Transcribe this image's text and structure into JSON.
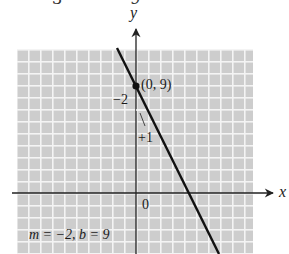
{
  "cropped_top_fragments": [
    "3",
    "9",
    "",
    ""
  ],
  "graph": {
    "axis_labels": {
      "x": "x",
      "y": "y"
    },
    "origin_label": "0",
    "point_label": "(0, 9)",
    "rise_label": "−2",
    "run_label": "+1",
    "caption": "m = −2, b = 9",
    "line": {
      "slope": -2,
      "intercept": 9
    },
    "colors": {
      "grid_bg": "#cfcfcf",
      "grid_lines": "#f2f2f2",
      "axis": "#222222",
      "line": "#111111"
    }
  }
}
